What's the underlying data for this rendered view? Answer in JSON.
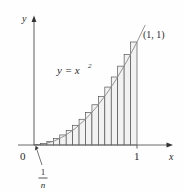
{
  "figure": {
    "background_color": "#fefefe",
    "axes": {
      "x_axis_label": "x",
      "y_axis_label": "y",
      "origin_label": "0",
      "x_tick_labels": [
        "1"
      ],
      "y_tick_labels": [],
      "axis_color": "#555555",
      "arrow_color": "#333333"
    },
    "annotations": {
      "curve_equation_label": "y = x",
      "curve_equation_exponent": "2",
      "point_label": "(1, 1)",
      "width_label_numerator": "1",
      "width_label_denominator": "n"
    },
    "style": {
      "rectangle_fill": "#f2f2f2",
      "rectangle_stroke": "#4a4a4a",
      "curve_stroke": "#8a8a8a",
      "text_color": "#2a2a2a",
      "leader_line_color": "#555555"
    }
  },
  "chart_data": {
    "type": "area",
    "xlabel": "x",
    "ylabel": "y",
    "xlim": [
      0,
      1.08
    ],
    "ylim": [
      0,
      1.15
    ],
    "grid": false,
    "legend_position": "none",
    "function": "y = x^2",
    "interval": [
      0,
      1
    ],
    "n_rectangles": 16,
    "rectangle_rule": "right-endpoint",
    "rectangle_width": 0.0625,
    "rectangle_width_label": "1/n",
    "x_right_endpoints": [
      0.0625,
      0.125,
      0.1875,
      0.25,
      0.3125,
      0.375,
      0.4375,
      0.5,
      0.5625,
      0.625,
      0.6875,
      0.75,
      0.8125,
      0.875,
      0.9375,
      1.0
    ],
    "rectangle_heights": [
      0.0039,
      0.0156,
      0.0352,
      0.0625,
      0.0977,
      0.1406,
      0.1914,
      0.25,
      0.3164,
      0.3906,
      0.4727,
      0.5625,
      0.6602,
      0.7656,
      0.8789,
      1.0
    ],
    "curve_points_x": [
      0,
      0.1,
      0.2,
      0.3,
      0.4,
      0.5,
      0.6,
      0.7,
      0.8,
      0.9,
      1.0,
      1.08
    ],
    "curve_points_y": [
      0,
      0.01,
      0.04,
      0.09,
      0.16,
      0.25,
      0.36,
      0.49,
      0.64,
      0.81,
      1.0,
      1.1664
    ],
    "marked_points": [
      {
        "label": "(1, 1)",
        "x": 1.0,
        "y": 1.0
      }
    ],
    "annotations": [
      {
        "text": "y = x^2",
        "x": 0.33,
        "y": 0.78
      },
      {
        "text": "1/n",
        "x": 0.045,
        "y": -0.33,
        "points_to": [
          0.035,
          0.01
        ]
      }
    ],
    "axis_tick_positions_x": [
      1.0
    ],
    "axis_tick_labels_x": [
      "1"
    ]
  }
}
